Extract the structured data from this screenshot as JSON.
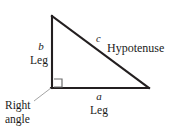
{
  "figure": {
    "background_color": "#ffffff",
    "stroke_color": "#231f20",
    "leader_color": "#9a9a9a",
    "marker_color": "#6e6e6e"
  },
  "geometry": {
    "apex": {
      "x": 52,
      "y": 16
    },
    "right_angle_vertex": {
      "x": 52,
      "y": 88
    },
    "base_right_vertex": {
      "x": 149,
      "y": 88
    },
    "right_angle_marker": {
      "x": 54,
      "y": 79,
      "size": 8
    },
    "leader_line": {
      "x1": 34,
      "y1": 101,
      "x2": 51,
      "y2": 88
    }
  },
  "labels": {
    "side_b_symbol": "b",
    "side_b_name": "Leg",
    "side_a_symbol": "a",
    "side_a_name": "Leg",
    "side_c_symbol": "c",
    "side_c_name": "Hypotenuse",
    "right_angle_line1": "Right",
    "right_angle_line2": "angle"
  }
}
